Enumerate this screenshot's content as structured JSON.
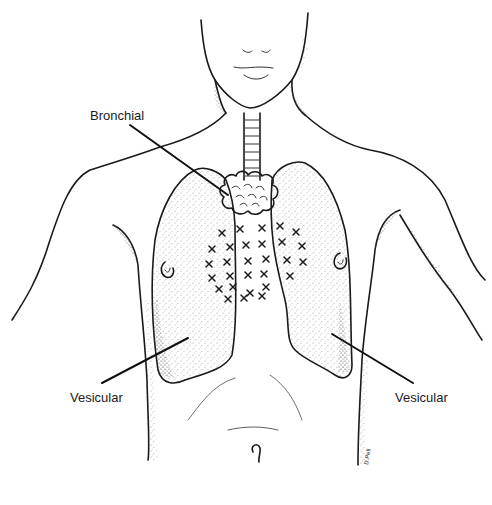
{
  "figure": {
    "labels": {
      "bronchial": "Bronchial",
      "vesicular_left": "Vesicular",
      "vesicular_right": "Vesicular"
    },
    "colors": {
      "ink": "#1a1a1a",
      "background": "#ffffff",
      "stipple": "#555555"
    },
    "x_marks": [
      [
        222,
        233
      ],
      [
        240,
        229
      ],
      [
        262,
        228
      ],
      [
        280,
        226
      ],
      [
        296,
        232
      ],
      [
        212,
        249
      ],
      [
        230,
        247
      ],
      [
        246,
        245
      ],
      [
        262,
        244
      ],
      [
        282,
        242
      ],
      [
        302,
        246
      ],
      [
        209,
        264
      ],
      [
        227,
        262
      ],
      [
        248,
        261
      ],
      [
        266,
        259
      ],
      [
        287,
        260
      ],
      [
        303,
        262
      ],
      [
        212,
        278
      ],
      [
        230,
        276
      ],
      [
        248,
        275
      ],
      [
        264,
        274
      ],
      [
        290,
        276
      ],
      [
        219,
        289
      ],
      [
        233,
        287
      ],
      [
        250,
        293
      ],
      [
        266,
        287
      ],
      [
        228,
        299
      ],
      [
        244,
        298
      ],
      [
        262,
        296
      ]
    ]
  }
}
